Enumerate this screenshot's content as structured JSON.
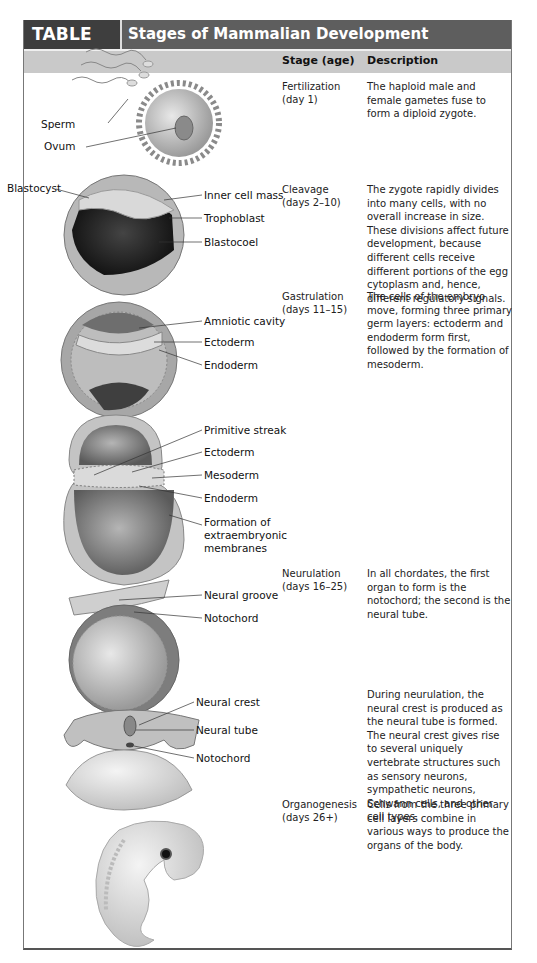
{
  "table": {
    "number": "TABLE 31.1",
    "title": "Stages of Mammalian Development",
    "columns": [
      "Stage (age)",
      "Description"
    ],
    "colors": {
      "title_bar": "#5e5e5e",
      "number_bar": "#3e3e3e",
      "header_row": "#c9c9c9"
    },
    "rows": [
      {
        "stage": "Fertilization",
        "age": "(day 1)",
        "description": "The haploid male and female gametes fuse to form a diploid zygote.",
        "labels": [
          "Sperm",
          "Ovum"
        ]
      },
      {
        "stage": "Cleavage",
        "age": "(days 2–10)",
        "description": "The zygote rapidly divides into many cells, with no overall increase in size. These divisions affect future development, because different cells receive different portions of the egg cytoplasm and, hence, different regulatory signals.",
        "labels": [
          "Blastocyst",
          "Inner cell mass",
          "Trophoblast",
          "Blastocoel"
        ]
      },
      {
        "stage": "Gastrulation",
        "age": "(days 11–15)",
        "description": "The cells of the embryo move, forming three primary germ layers: ectoderm and endoderm form first, followed by the formation of mesoderm.",
        "labels": [
          "Amniotic cavity",
          "Ectoderm",
          "Endoderm"
        ]
      },
      {
        "stage": "",
        "age": "",
        "description": "",
        "labels": [
          "Primitive streak",
          "Ectoderm",
          "Mesoderm",
          "Endoderm",
          "Formation of",
          "extraembryonic",
          "membranes"
        ]
      },
      {
        "stage": "Neurulation",
        "age": "(days 16–25)",
        "description": "In all chordates, the first organ to form is the notochord; the second is the neural tube.",
        "labels": [
          "Neural groove",
          "Notochord"
        ]
      },
      {
        "stage": "",
        "age": "",
        "description": "During neurulation, the neural crest is produced as the neural tube is formed. The neural crest gives rise to several uniquely vertebrate structures such as sensory neurons, sympathetic neurons, Schwann cells, and other cell types.",
        "labels": [
          "Neural crest",
          "Neural tube",
          "Notochord"
        ]
      },
      {
        "stage": "Organogenesis",
        "age": "(days 26+)",
        "description": "Cells from the three primary cell layers combine in various ways to produce the organs of the body.",
        "labels": []
      }
    ]
  }
}
